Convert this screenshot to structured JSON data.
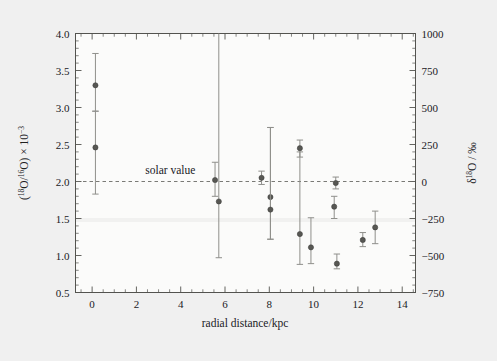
{
  "figure": {
    "background_color": "#f0f0f0",
    "panel_color": "#fbfbfa",
    "axis_color": "#53534f",
    "marker_color": "#575753",
    "errorbar_color": "#8f8f8b"
  },
  "chart_data": {
    "type": "scatter",
    "title": "",
    "xlabel": "radial distance/kpc",
    "ylabel": "(18O/16O) × 10−3",
    "ylabel_parts": {
      "open": "(",
      "iso1_sup": "18",
      "iso1_base": "O/",
      "iso2_sup": "16",
      "iso2_base": "O",
      "close": ") × 10",
      "exponent": "−3"
    },
    "y2label": "δ18O / ‰",
    "y2label_parts": {
      "delta": "δ",
      "mass_sup": "18",
      "element": "O / ",
      "permil": "‰"
    },
    "xlim": [
      -0.75,
      14.6
    ],
    "ylim": [
      0.5,
      4.0
    ],
    "y2lim": [
      -750,
      1000
    ],
    "xticks": [
      0,
      2,
      4,
      6,
      8,
      10,
      12,
      14
    ],
    "xticklabels": [
      "0",
      "2",
      "4",
      "6",
      "8",
      "10",
      "12",
      "14"
    ],
    "yticks": [
      0.5,
      1.0,
      1.5,
      2.0,
      2.5,
      3.0,
      3.5,
      4.0
    ],
    "yticklabels": [
      "0.5",
      "1.0",
      "1.5",
      "2.0",
      "2.5",
      "3.0",
      "3.5",
      "4.0"
    ],
    "y2ticks": [
      -750,
      -500,
      -250,
      0,
      250,
      500,
      750,
      1000
    ],
    "y2ticklabels": [
      "−750",
      "−500",
      "−250",
      "0",
      "250",
      "500",
      "750",
      "1000"
    ],
    "x_minor_step": 0.5,
    "y_minor_step": 0.1,
    "grid": false,
    "legend": null,
    "annotations": [
      {
        "text": "solar value",
        "x": 2.4,
        "y": 2.1,
        "anchor": "start"
      }
    ],
    "reference_lines": [
      {
        "name": "solar-value-line",
        "orientation": "horizontal",
        "y": 2.0,
        "y2": 0,
        "style": "dashed"
      }
    ],
    "points": [
      {
        "x": 0.15,
        "y": 3.3,
        "yerr_low": 2.95,
        "yerr_high": 3.73
      },
      {
        "x": 0.15,
        "y": 2.46,
        "yerr_low": 1.83,
        "yerr_high": 2.95
      },
      {
        "x": 5.55,
        "y": 2.02,
        "yerr_low": 1.8,
        "yerr_high": 2.26
      },
      {
        "x": 5.72,
        "y": 1.73,
        "yerr_low": 0.97,
        "yerr_high": 4.0
      },
      {
        "x": 7.65,
        "y": 2.05,
        "yerr_low": 1.96,
        "yerr_high": 2.14
      },
      {
        "x": 8.05,
        "y": 1.79,
        "yerr_low": 1.22,
        "yerr_high": 2.73
      },
      {
        "x": 8.05,
        "y": 1.62,
        "yerr_low": 1.22,
        "yerr_high": 2.73
      },
      {
        "x": 9.38,
        "y": 2.45,
        "yerr_low": 2.33,
        "yerr_high": 2.56
      },
      {
        "x": 9.38,
        "y": 1.29,
        "yerr_low": 0.88,
        "yerr_high": 2.4
      },
      {
        "x": 9.88,
        "y": 1.11,
        "yerr_low": 0.89,
        "yerr_high": 1.51
      },
      {
        "x": 10.93,
        "y": 1.66,
        "yerr_low": 1.5,
        "yerr_high": 1.8
      },
      {
        "x": 11.0,
        "y": 1.98,
        "yerr_low": 1.9,
        "yerr_high": 2.06
      },
      {
        "x": 11.05,
        "y": 0.89,
        "yerr_low": 0.82,
        "yerr_high": 1.02
      },
      {
        "x": 12.22,
        "y": 1.21,
        "yerr_low": 1.12,
        "yerr_high": 1.31
      },
      {
        "x": 12.78,
        "y": 1.38,
        "yerr_low": 1.16,
        "yerr_high": 1.6
      }
    ]
  }
}
